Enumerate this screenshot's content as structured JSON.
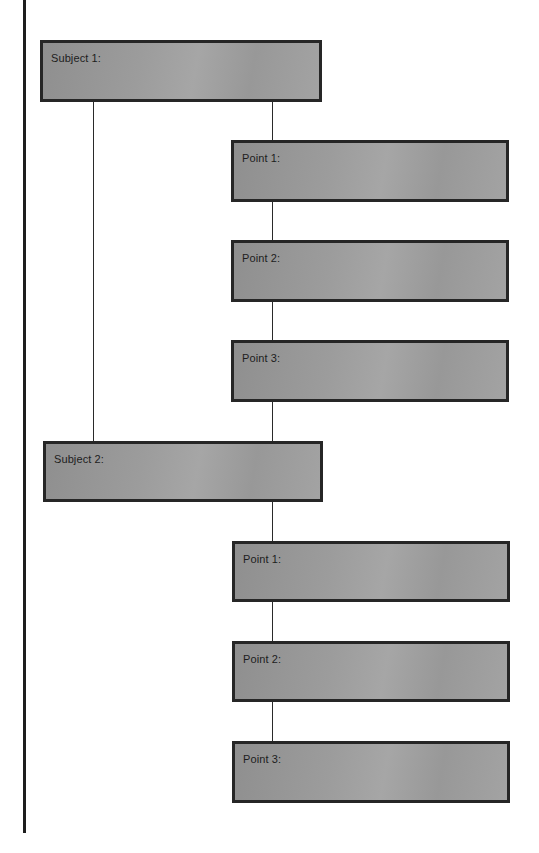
{
  "diagram": {
    "type": "hierarchical-outline",
    "colors": {
      "box_fill": "#9c9c9c",
      "box_border": "#262626",
      "line": "#2a2a2a",
      "text": "#1d1d1d",
      "background": "#ffffff"
    },
    "subjects": [
      {
        "label": "Subject 1:",
        "points": [
          {
            "label": "Point 1:"
          },
          {
            "label": "Point 2:"
          },
          {
            "label": "Point 3:"
          }
        ]
      },
      {
        "label": "Subject 2:",
        "points": [
          {
            "label": "Point 1:"
          },
          {
            "label": "Point 2:"
          },
          {
            "label": "Point 3:"
          }
        ]
      }
    ]
  }
}
